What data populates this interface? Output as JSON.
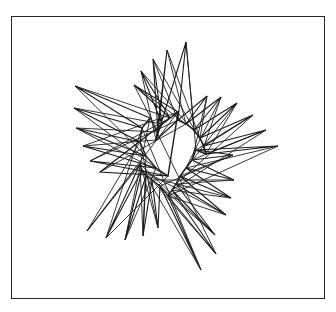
{
  "figure": {
    "frame": {
      "x": 11,
      "y": 16,
      "width": 314,
      "height": 283
    },
    "stroke_color": "#1e1e1e",
    "background": "#ffffff",
    "tips": [
      [
        75,
        86
      ],
      [
        74,
        108
      ],
      [
        76,
        128
      ],
      [
        83,
        146
      ],
      [
        90,
        161
      ],
      [
        100,
        172
      ],
      [
        134,
        85
      ],
      [
        141,
        71
      ],
      [
        153,
        59
      ],
      [
        167,
        50
      ],
      [
        186,
        42
      ],
      [
        207,
        96
      ],
      [
        221,
        97
      ],
      [
        237,
        103
      ],
      [
        253,
        115
      ],
      [
        266,
        130
      ],
      [
        278,
        146
      ],
      [
        233,
        155
      ],
      [
        234,
        180
      ],
      [
        231,
        198
      ],
      [
        226,
        215
      ],
      [
        215,
        235
      ],
      [
        216,
        254
      ],
      [
        201,
        270
      ],
      [
        158,
        228
      ],
      [
        143,
        236
      ],
      [
        125,
        240
      ],
      [
        106,
        238
      ],
      [
        87,
        231
      ]
    ],
    "hubs": [
      [
        150,
        118
      ],
      [
        142,
        128
      ],
      [
        140,
        142
      ],
      [
        146,
        156
      ],
      [
        156,
        168
      ],
      [
        168,
        176
      ],
      [
        178,
        112
      ],
      [
        170,
        118
      ],
      [
        162,
        124
      ],
      [
        158,
        132
      ],
      [
        156,
        140
      ],
      [
        178,
        120
      ],
      [
        186,
        124
      ],
      [
        194,
        130
      ],
      [
        200,
        138
      ],
      [
        204,
        146
      ],
      [
        206,
        154
      ],
      [
        196,
        150
      ],
      [
        192,
        160
      ],
      [
        186,
        168
      ],
      [
        180,
        176
      ],
      [
        176,
        184
      ],
      [
        172,
        190
      ],
      [
        168,
        196
      ],
      [
        160,
        186
      ],
      [
        152,
        180
      ],
      [
        146,
        176
      ],
      [
        142,
        170
      ],
      [
        140,
        164
      ]
    ]
  }
}
